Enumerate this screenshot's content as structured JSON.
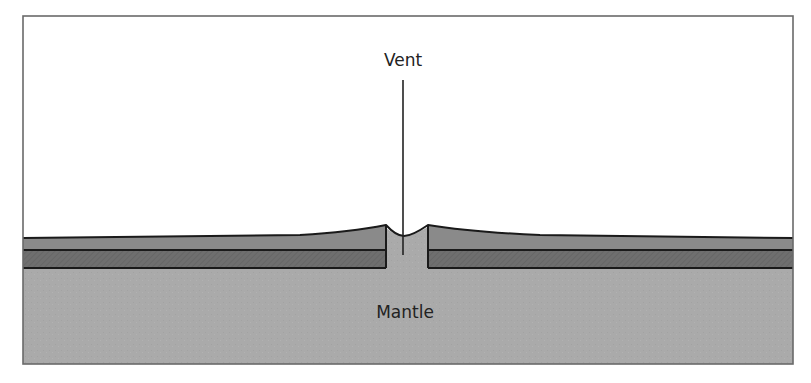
{
  "diagram": {
    "labels": {
      "vent": "Vent",
      "mantle": "Mantle"
    },
    "colors": {
      "background": "#ffffff",
      "frame": "#6a6a6a",
      "mantle": "#aaaaaa",
      "upper_layer": "#8a8a8a",
      "lower_layer": "#6f6f6f",
      "outline": "#1a1a1a"
    },
    "layers": [
      {
        "name": "upper-crust-layer",
        "type": "sloping layer thickening toward vent"
      },
      {
        "name": "lower-crust-layer",
        "type": "flat dark layer"
      },
      {
        "name": "mantle",
        "type": "base region"
      }
    ]
  }
}
